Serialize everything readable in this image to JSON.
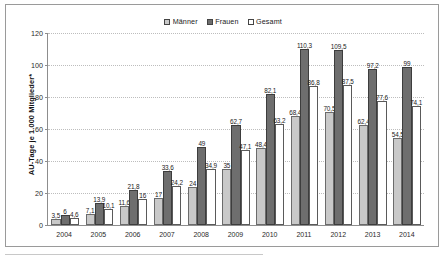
{
  "chart_data": {
    "type": "bar",
    "title": "",
    "subtitle": "",
    "xlabel": "",
    "ylabel": "AU-Tage je 1.000 Mitglieder*",
    "ylim": [
      0,
      120
    ],
    "yticks": [
      0,
      20,
      40,
      60,
      80,
      100,
      120
    ],
    "grid": true,
    "legend_position": "top-center",
    "categories": [
      "2004",
      "2005",
      "2006",
      "2007",
      "2008",
      "2009",
      "2010",
      "2011",
      "2012",
      "2013",
      "2014"
    ],
    "series": [
      {
        "name": "Männer",
        "color": "#c9c9c9",
        "values": [
          3.5,
          7.1,
          11.6,
          17,
          24,
          35,
          48.4,
          68.4,
          70.5,
          62.4,
          54.5
        ],
        "labels": [
          "3,5",
          "7,1",
          "11,6",
          "17",
          "24",
          "35",
          "48,4",
          "68,4",
          "70,5",
          "62,4",
          "54,5"
        ]
      },
      {
        "name": "Frauen",
        "color": "#6e6e6e",
        "values": [
          6,
          13.9,
          21.8,
          33.6,
          49,
          62.7,
          82.1,
          110.3,
          109.5,
          97.2,
          99
        ],
        "labels": [
          "6",
          "13,9",
          "21,8",
          "33,6",
          "49",
          "62,7",
          "82,1",
          "110,3",
          "109,5",
          "97,2",
          "99"
        ]
      },
      {
        "name": "Gesamt",
        "color": "#ffffff",
        "values": [
          4.6,
          10.1,
          16,
          24.2,
          34.9,
          47.1,
          63.2,
          86.8,
          87.5,
          77.6,
          74.1
        ],
        "labels": [
          "4,6",
          "10,1",
          "16",
          "24,2",
          "34,9",
          "47,1",
          "63,2",
          "86,8",
          "87,5",
          "77,6",
          "74,1"
        ]
      }
    ]
  },
  "legend": {
    "items": [
      {
        "label": "Männer"
      },
      {
        "label": "Frauen"
      },
      {
        "label": "Gesamt"
      }
    ]
  }
}
